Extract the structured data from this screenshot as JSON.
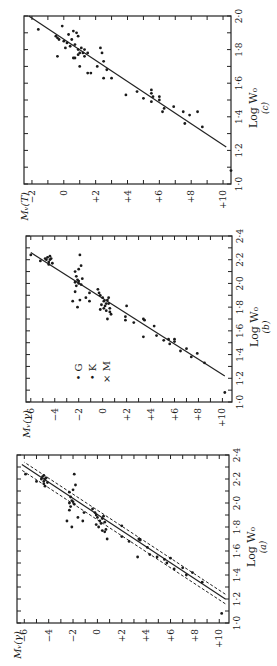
{
  "figure": {
    "panels": [
      "c",
      "b",
      "a"
    ]
  },
  "chart_data": [
    {
      "id": "c",
      "type": "scatter",
      "panel_label": "(c)",
      "xlabel": "Log W₀",
      "ylabel": "Mᵥ(T)",
      "xlim": [
        1.0,
        2.0
      ],
      "ylim": [
        10.5,
        -2.5
      ],
      "x_ticks": [
        1.0,
        1.2,
        1.4,
        1.6,
        1.8,
        2.0
      ],
      "x_tick_labels": [
        "1·0",
        "1·2",
        "1·4",
        "1·6",
        "1·8",
        "2·0"
      ],
      "y_ticks": [
        -2,
        0,
        2,
        4,
        6,
        8,
        10
      ],
      "y_tick_labels": [
        "−2",
        "0",
        "+2",
        "+4",
        "+6",
        "+8",
        "+10"
      ],
      "fit_line": {
        "x": [
          1.22,
          2.0
        ],
        "y": [
          10.2,
          -2.2
        ],
        "style": "solid"
      },
      "points": [
        [
          1.92,
          -1.6
        ],
        [
          1.94,
          -0.1
        ],
        [
          1.88,
          -0.5
        ],
        [
          1.87,
          -0.4
        ],
        [
          1.86,
          -0.3
        ],
        [
          1.85,
          0.0
        ],
        [
          1.84,
          0.2
        ],
        [
          1.76,
          -0.4
        ],
        [
          1.81,
          0.1
        ],
        [
          1.89,
          0.3
        ],
        [
          1.91,
          0.6
        ],
        [
          1.9,
          0.8
        ],
        [
          1.88,
          0.9
        ],
        [
          1.86,
          0.5
        ],
        [
          1.83,
          0.7
        ],
        [
          1.82,
          0.4
        ],
        [
          1.8,
          0.9
        ],
        [
          1.78,
          1.0
        ],
        [
          1.77,
          0.9
        ],
        [
          1.75,
          0.6
        ],
        [
          1.75,
          0.7
        ],
        [
          1.78,
          1.2
        ],
        [
          1.8,
          1.3
        ],
        [
          1.81,
          1.1
        ],
        [
          1.76,
          1.3
        ],
        [
          1.7,
          1.0
        ],
        [
          1.78,
          1.5
        ],
        [
          1.66,
          1.5
        ],
        [
          1.66,
          1.7
        ],
        [
          1.81,
          2.3
        ],
        [
          1.78,
          2.4
        ],
        [
          1.73,
          2.5
        ],
        [
          1.7,
          2.1
        ],
        [
          1.68,
          2.7
        ],
        [
          1.63,
          2.5
        ],
        [
          1.63,
          3.0
        ],
        [
          1.53,
          3.9
        ],
        [
          1.55,
          4.6
        ],
        [
          1.51,
          5.0
        ],
        [
          1.56,
          5.5
        ],
        [
          1.54,
          5.5
        ],
        [
          1.52,
          5.6
        ],
        [
          1.49,
          5.5
        ],
        [
          1.52,
          6.0
        ],
        [
          1.5,
          6.0
        ],
        [
          1.43,
          6.2
        ],
        [
          1.45,
          6.3
        ],
        [
          1.46,
          6.9
        ],
        [
          1.43,
          7.5
        ],
        [
          1.36,
          7.6
        ],
        [
          1.41,
          7.9
        ],
        [
          1.43,
          8.4
        ],
        [
          1.34,
          8.7
        ],
        [
          1.08,
          10.5
        ]
      ]
    },
    {
      "id": "b",
      "type": "scatter",
      "panel_label": "(b)",
      "xlabel": "Log W₀",
      "ylabel": "Mᵥ(γ)",
      "xlim": [
        1.0,
        2.4
      ],
      "ylim": [
        10.8,
        -6.4
      ],
      "x_ticks": [
        1.0,
        1.2,
        1.4,
        1.6,
        1.8,
        2.0,
        2.2,
        2.4
      ],
      "x_tick_labels": [
        "1·0",
        "1·2",
        "1·4",
        "1·6",
        "1·8",
        "2·0",
        "2·2",
        "2·4"
      ],
      "y_ticks": [
        -6,
        -4,
        -2,
        0,
        2,
        4,
        6,
        8,
        10
      ],
      "y_tick_labels": [
        "−6",
        "−4",
        "−2",
        "0",
        "+2",
        "+4",
        "+6",
        "+8",
        "+10"
      ],
      "legend": [
        {
          "symbol": "•",
          "label": "G"
        },
        {
          "symbol": "•",
          "label": "K"
        },
        {
          "symbol": "×",
          "label": "M"
        }
      ],
      "fit_line": {
        "x": [
          1.22,
          2.26
        ],
        "y": [
          10.2,
          -6.0
        ],
        "style": "solid"
      },
      "points": [
        [
          2.24,
          -6.0
        ],
        [
          2.19,
          -5.2
        ],
        [
          2.22,
          -4.6
        ],
        [
          2.2,
          -4.4
        ],
        [
          2.18,
          -4.5
        ],
        [
          2.21,
          -4.3
        ],
        [
          2.23,
          -4.4
        ],
        [
          2.17,
          -4.2
        ],
        [
          2.2,
          -4.7
        ],
        [
          2.16,
          -4.5
        ],
        [
          2.21,
          -4.8
        ],
        [
          2.24,
          -1.9
        ],
        [
          2.15,
          -1.8
        ],
        [
          2.12,
          -2.0
        ],
        [
          2.1,
          -2.3
        ],
        [
          2.06,
          -2.2
        ],
        [
          2.03,
          -2.1
        ],
        [
          2.01,
          -2.3
        ],
        [
          2.0,
          -2.0
        ],
        [
          1.99,
          -1.8
        ],
        [
          2.02,
          -2.0
        ],
        [
          1.98,
          -2.2
        ],
        [
          2.04,
          -1.7
        ],
        [
          1.93,
          -2.3
        ],
        [
          1.85,
          -2.5
        ],
        [
          1.86,
          -1.9
        ],
        [
          1.8,
          -2.1
        ],
        [
          1.88,
          -1.4
        ],
        [
          1.85,
          -1.1
        ],
        [
          1.92,
          -1.1
        ],
        [
          1.95,
          -0.4
        ],
        [
          1.92,
          -0.3
        ],
        [
          1.9,
          -0.2
        ],
        [
          1.88,
          0.0
        ],
        [
          1.85,
          0.1
        ],
        [
          1.83,
          0.3
        ],
        [
          1.81,
          0.2
        ],
        [
          1.79,
          0.1
        ],
        [
          1.77,
          0.3
        ],
        [
          1.76,
          0.6
        ],
        [
          1.79,
          0.6
        ],
        [
          1.83,
          0.5
        ],
        [
          1.86,
          0.4
        ],
        [
          1.88,
          0.5
        ],
        [
          1.82,
          -0.1
        ],
        [
          1.78,
          -0.2
        ],
        [
          1.74,
          0.7
        ],
        [
          1.7,
          0.4
        ],
        [
          1.72,
          1.9
        ],
        [
          1.69,
          1.9
        ],
        [
          1.81,
          2.0
        ],
        [
          1.67,
          2.6
        ],
        [
          1.7,
          3.4
        ],
        [
          1.69,
          3.5
        ],
        [
          1.55,
          3.4
        ],
        [
          1.64,
          4.3
        ],
        [
          1.56,
          4.5
        ],
        [
          1.52,
          5.1
        ],
        [
          1.53,
          5.5
        ],
        [
          1.53,
          6.0
        ],
        [
          1.51,
          6.0
        ],
        [
          1.49,
          5.6
        ],
        [
          1.43,
          6.5
        ],
        [
          1.45,
          7.0
        ],
        [
          1.38,
          7.4
        ],
        [
          1.41,
          7.9
        ],
        [
          1.33,
          8.5
        ],
        [
          1.08,
          10.2
        ]
      ]
    },
    {
      "id": "a",
      "type": "scatter",
      "panel_label": "(a)",
      "xlabel": "Log W₀",
      "ylabel": "Mᵥ(γ)",
      "xlim": [
        1.0,
        2.4
      ],
      "ylim": [
        10.8,
        -6.6
      ],
      "x_ticks": [
        1.0,
        1.2,
        1.4,
        1.6,
        1.8,
        2.0,
        2.2,
        2.4
      ],
      "x_tick_labels": [
        "1·0",
        "1·2",
        "1·4",
        "1·6",
        "1·8",
        "2·0",
        "2·2",
        "2·4"
      ],
      "y_ticks": [
        -6,
        -4,
        -2,
        0,
        2,
        4,
        6,
        8,
        10
      ],
      "y_tick_labels": [
        "−6",
        "−4",
        "−2",
        "0",
        "+2",
        "+4",
        "+6",
        "+8",
        "+10"
      ],
      "fit_line": {
        "x": [
          1.2,
          2.32
        ],
        "y": [
          10.5,
          -6.2
        ],
        "style": "solid"
      },
      "bound_lines": [
        {
          "x": [
            1.24,
            2.34
          ],
          "y": [
            10.5,
            -6.0
          ],
          "style": "dashed"
        },
        {
          "x": [
            1.16,
            2.28
          ],
          "y": [
            10.5,
            -6.3
          ],
          "style": "dashed"
        }
      ],
      "points": [
        [
          2.24,
          -5.9
        ],
        [
          2.18,
          -5.0
        ],
        [
          2.22,
          -4.5
        ],
        [
          2.2,
          -4.3
        ],
        [
          2.18,
          -4.4
        ],
        [
          2.21,
          -4.2
        ],
        [
          2.23,
          -4.4
        ],
        [
          2.17,
          -4.1
        ],
        [
          2.2,
          -4.6
        ],
        [
          2.16,
          -4.4
        ],
        [
          2.14,
          -4.3
        ],
        [
          2.24,
          -1.9
        ],
        [
          2.15,
          -1.8
        ],
        [
          2.11,
          -2.0
        ],
        [
          2.09,
          -2.3
        ],
        [
          2.05,
          -2.2
        ],
        [
          2.02,
          -2.1
        ],
        [
          2.0,
          -2.3
        ],
        [
          1.99,
          -1.9
        ],
        [
          2.01,
          -2.0
        ],
        [
          1.97,
          -2.2
        ],
        [
          1.94,
          -2.3
        ],
        [
          1.85,
          -2.5
        ],
        [
          1.85,
          -1.2
        ],
        [
          1.8,
          -2.1
        ],
        [
          1.88,
          -1.6
        ],
        [
          1.92,
          -1.1
        ],
        [
          1.95,
          -0.4
        ],
        [
          1.92,
          -0.2
        ],
        [
          1.9,
          -0.1
        ],
        [
          1.88,
          0.0
        ],
        [
          1.85,
          0.2
        ],
        [
          1.83,
          0.3
        ],
        [
          1.8,
          0.1
        ],
        [
          1.77,
          0.4
        ],
        [
          1.76,
          0.6
        ],
        [
          1.78,
          0.7
        ],
        [
          1.84,
          0.6
        ],
        [
          1.87,
          0.4
        ],
        [
          1.89,
          0.5
        ],
        [
          1.82,
          -0.1
        ],
        [
          1.7,
          0.8
        ],
        [
          1.72,
          2.0
        ],
        [
          1.81,
          2.0
        ],
        [
          1.68,
          2.6
        ],
        [
          1.7,
          3.4
        ],
        [
          1.69,
          3.5
        ],
        [
          1.55,
          3.3
        ],
        [
          1.63,
          4.1
        ],
        [
          1.57,
          4.3
        ],
        [
          1.55,
          4.9
        ],
        [
          1.53,
          5.5
        ],
        [
          1.54,
          6.0
        ],
        [
          1.5,
          5.7
        ],
        [
          1.45,
          6.3
        ],
        [
          1.46,
          7.0
        ],
        [
          1.4,
          7.3
        ],
        [
          1.42,
          7.8
        ],
        [
          1.34,
          8.6
        ],
        [
          1.08,
          10.2
        ]
      ]
    }
  ]
}
